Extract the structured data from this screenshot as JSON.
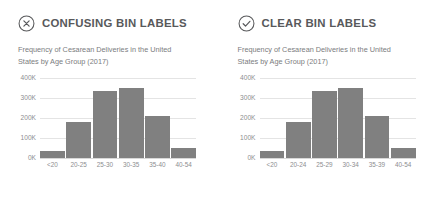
{
  "panels": [
    {
      "status_icon": "circle-x-icon",
      "title": "CONFUSING BIN LABELS",
      "subtitle": "Frequency of Cesarean Deliveries in the United States by Age Group (2017)",
      "chart_data": {
        "type": "bar",
        "title": "Frequency of Cesarean Deliveries in the United States by Age Group (2017)",
        "categories": [
          "<20",
          "20-25",
          "25-30",
          "30-35",
          "35-40",
          "40-54"
        ],
        "values": [
          35000,
          180000,
          335000,
          350000,
          210000,
          50000
        ],
        "xlabel": "",
        "ylabel": "",
        "ylim": [
          0,
          400000
        ],
        "yticks": [
          0,
          100000,
          200000,
          300000,
          400000
        ],
        "ytick_labels": [
          "0K",
          "100K",
          "200K",
          "300K",
          "400K"
        ],
        "grid": true,
        "legend": "none",
        "bar_color": "#808080"
      }
    },
    {
      "status_icon": "circle-check-icon",
      "title": "CLEAR BIN LABELS",
      "subtitle": "Frequency of Cesarean Deliveries in the United States by Age Group (2017)",
      "chart_data": {
        "type": "bar",
        "title": "Frequency of Cesarean Deliveries in the United States by Age Group (2017)",
        "categories": [
          "<20",
          "20-24",
          "25-29",
          "30-34",
          "35-39",
          "40-54"
        ],
        "values": [
          35000,
          180000,
          335000,
          350000,
          210000,
          50000
        ],
        "xlabel": "",
        "ylabel": "",
        "ylim": [
          0,
          400000
        ],
        "yticks": [
          0,
          100000,
          200000,
          300000,
          400000
        ],
        "ytick_labels": [
          "0K",
          "100K",
          "200K",
          "300K",
          "400K"
        ],
        "grid": true,
        "legend": "none",
        "bar_color": "#808080"
      }
    }
  ],
  "colors": {
    "bar": "#808080",
    "text": "#58595b",
    "muted": "#8d8e90",
    "grid": "#e4e4e4",
    "background": "#ffffff"
  }
}
